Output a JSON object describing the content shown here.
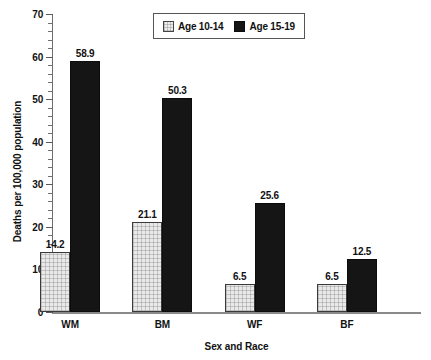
{
  "chart_data": {
    "type": "bar",
    "title": "",
    "xlabel": "Sex and Race",
    "ylabel": "Deaths per 100,000 population",
    "categories": [
      "WM",
      "BM",
      "WF",
      "BF"
    ],
    "series": [
      {
        "name": "Age 10-14",
        "values": [
          14.2,
          21.1,
          6.5,
          6.5
        ],
        "color": "#ededed",
        "pattern": "fine-grid"
      },
      {
        "name": "Age 15-19",
        "values": [
          58.9,
          50.3,
          25.6,
          12.5
        ],
        "color": "#151515",
        "pattern": "solid"
      }
    ],
    "value_labels": [
      [
        "14.2",
        "21.1",
        "6.5",
        "6.5"
      ],
      [
        "58.9",
        "50.3",
        "25.6",
        "12.5"
      ]
    ],
    "ylim": [
      0,
      70
    ],
    "ytick_labels": [
      "0",
      "10",
      "20",
      "30",
      "40",
      "50",
      "60",
      "70"
    ],
    "ytick_values": [
      0,
      10,
      20,
      30,
      40,
      50,
      60,
      70
    ],
    "yminor_step": 2,
    "grid": false,
    "legend_position": "top-center",
    "legend_entries": [
      "Age 10-14",
      "Age 15-19"
    ]
  }
}
